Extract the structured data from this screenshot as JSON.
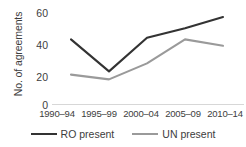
{
  "chart_data": {
    "type": "line",
    "title": "",
    "xlabel": "",
    "ylabel": "No. of agreements",
    "categories": [
      "1990–94",
      "1995–99",
      "2000–04",
      "2005–09",
      "2010–14"
    ],
    "series": [
      {
        "name": "RO present",
        "values": [
          41,
          21,
          42,
          48,
          55
        ],
        "color": "#333333"
      },
      {
        "name": "UN present",
        "values": [
          19,
          16,
          26,
          41,
          37
        ],
        "color": "#9a9a9a"
      }
    ],
    "ylim": [
      0,
      60
    ],
    "yticks": [
      60,
      40,
      20,
      0
    ],
    "grid": false,
    "legend_position": "bottom",
    "axis_color": "#d7d7d7"
  }
}
